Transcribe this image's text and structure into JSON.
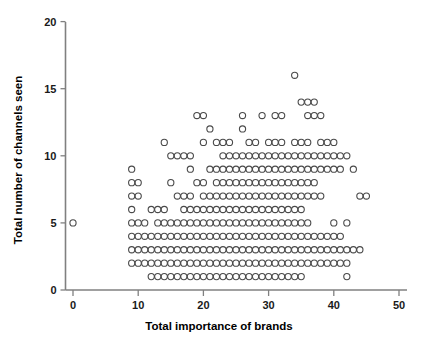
{
  "chart_data": {
    "type": "scatter",
    "title": "",
    "xlabel": "Total importance of brands",
    "ylabel": "Total number of channels seen",
    "xlim": [
      0,
      50
    ],
    "ylim": [
      0,
      20
    ],
    "xticks": [
      0,
      10,
      20,
      30,
      40,
      50
    ],
    "yticks": [
      0,
      5,
      10,
      15,
      20
    ],
    "xtick_labels": [
      "0",
      "10",
      "20",
      "30",
      "40",
      "50"
    ],
    "ytick_labels": [
      "0",
      "5",
      "10",
      "15",
      "20"
    ],
    "grid": false,
    "legend": null,
    "marker": {
      "shape": "open-circle",
      "radius_px": 3.1,
      "stroke": "#4a4a4a",
      "fill": "none"
    },
    "axis_color": "#808080",
    "points": [
      [
        0,
        5
      ],
      [
        9,
        9
      ],
      [
        9,
        8
      ],
      [
        9,
        7
      ],
      [
        9,
        6
      ],
      [
        9,
        5
      ],
      [
        9,
        4
      ],
      [
        9,
        3
      ],
      [
        9,
        2
      ],
      [
        10,
        8
      ],
      [
        10,
        7
      ],
      [
        10,
        5
      ],
      [
        10,
        4
      ],
      [
        10,
        3
      ],
      [
        10,
        2
      ],
      [
        11,
        5
      ],
      [
        11,
        4
      ],
      [
        11,
        3
      ],
      [
        11,
        2
      ],
      [
        12,
        6
      ],
      [
        12,
        4
      ],
      [
        12,
        3
      ],
      [
        12,
        2
      ],
      [
        12,
        1
      ],
      [
        13,
        6
      ],
      [
        13,
        5
      ],
      [
        13,
        4
      ],
      [
        13,
        3
      ],
      [
        13,
        2
      ],
      [
        13,
        1
      ],
      [
        14,
        11
      ],
      [
        14,
        6
      ],
      [
        14,
        5
      ],
      [
        14,
        4
      ],
      [
        14,
        3
      ],
      [
        14,
        2
      ],
      [
        14,
        1
      ],
      [
        15,
        10
      ],
      [
        15,
        8
      ],
      [
        15,
        5
      ],
      [
        15,
        4
      ],
      [
        15,
        3
      ],
      [
        15,
        2
      ],
      [
        15,
        1
      ],
      [
        16,
        10
      ],
      [
        16,
        7
      ],
      [
        16,
        5
      ],
      [
        16,
        4
      ],
      [
        16,
        3
      ],
      [
        16,
        2
      ],
      [
        16,
        1
      ],
      [
        17,
        10
      ],
      [
        17,
        7
      ],
      [
        17,
        6
      ],
      [
        17,
        5
      ],
      [
        17,
        4
      ],
      [
        17,
        3
      ],
      [
        17,
        2
      ],
      [
        17,
        1
      ],
      [
        18,
        10
      ],
      [
        18,
        9
      ],
      [
        18,
        7
      ],
      [
        18,
        6
      ],
      [
        18,
        5
      ],
      [
        18,
        4
      ],
      [
        18,
        3
      ],
      [
        18,
        2
      ],
      [
        18,
        1
      ],
      [
        19,
        13
      ],
      [
        19,
        8
      ],
      [
        19,
        6
      ],
      [
        19,
        5
      ],
      [
        19,
        4
      ],
      [
        19,
        3
      ],
      [
        19,
        2
      ],
      [
        19,
        1
      ],
      [
        20,
        13
      ],
      [
        20,
        11
      ],
      [
        20,
        8
      ],
      [
        20,
        7
      ],
      [
        20,
        6
      ],
      [
        20,
        5
      ],
      [
        20,
        4
      ],
      [
        20,
        3
      ],
      [
        20,
        2
      ],
      [
        20,
        1
      ],
      [
        21,
        12
      ],
      [
        21,
        9
      ],
      [
        21,
        7
      ],
      [
        21,
        6
      ],
      [
        21,
        5
      ],
      [
        21,
        4
      ],
      [
        21,
        3
      ],
      [
        21,
        2
      ],
      [
        21,
        1
      ],
      [
        22,
        11
      ],
      [
        22,
        9
      ],
      [
        22,
        8
      ],
      [
        22,
        7
      ],
      [
        22,
        6
      ],
      [
        22,
        5
      ],
      [
        22,
        4
      ],
      [
        22,
        3
      ],
      [
        22,
        2
      ],
      [
        22,
        1
      ],
      [
        23,
        11
      ],
      [
        23,
        10
      ],
      [
        23,
        9
      ],
      [
        23,
        8
      ],
      [
        23,
        7
      ],
      [
        23,
        6
      ],
      [
        23,
        5
      ],
      [
        23,
        4
      ],
      [
        23,
        3
      ],
      [
        23,
        2
      ],
      [
        23,
        1
      ],
      [
        24,
        11
      ],
      [
        24,
        10
      ],
      [
        24,
        9
      ],
      [
        24,
        8
      ],
      [
        24,
        7
      ],
      [
        24,
        6
      ],
      [
        24,
        5
      ],
      [
        24,
        4
      ],
      [
        24,
        3
      ],
      [
        24,
        2
      ],
      [
        24,
        1
      ],
      [
        25,
        10
      ],
      [
        25,
        9
      ],
      [
        25,
        8
      ],
      [
        25,
        7
      ],
      [
        25,
        6
      ],
      [
        25,
        5
      ],
      [
        25,
        4
      ],
      [
        25,
        3
      ],
      [
        25,
        2
      ],
      [
        25,
        1
      ],
      [
        26,
        13
      ],
      [
        26,
        12
      ],
      [
        26,
        10
      ],
      [
        26,
        9
      ],
      [
        26,
        8
      ],
      [
        26,
        7
      ],
      [
        26,
        6
      ],
      [
        26,
        5
      ],
      [
        26,
        4
      ],
      [
        26,
        3
      ],
      [
        26,
        2
      ],
      [
        26,
        1
      ],
      [
        27,
        11
      ],
      [
        27,
        10
      ],
      [
        27,
        9
      ],
      [
        27,
        8
      ],
      [
        27,
        7
      ],
      [
        27,
        6
      ],
      [
        27,
        5
      ],
      [
        27,
        4
      ],
      [
        27,
        3
      ],
      [
        27,
        2
      ],
      [
        27,
        1
      ],
      [
        28,
        11
      ],
      [
        28,
        10
      ],
      [
        28,
        9
      ],
      [
        28,
        8
      ],
      [
        28,
        7
      ],
      [
        28,
        6
      ],
      [
        28,
        5
      ],
      [
        28,
        4
      ],
      [
        28,
        3
      ],
      [
        28,
        2
      ],
      [
        28,
        1
      ],
      [
        29,
        13
      ],
      [
        29,
        10
      ],
      [
        29,
        9
      ],
      [
        29,
        8
      ],
      [
        29,
        7
      ],
      [
        29,
        6
      ],
      [
        29,
        5
      ],
      [
        29,
        4
      ],
      [
        29,
        3
      ],
      [
        29,
        2
      ],
      [
        29,
        1
      ],
      [
        30,
        11
      ],
      [
        30,
        10
      ],
      [
        30,
        9
      ],
      [
        30,
        8
      ],
      [
        30,
        7
      ],
      [
        30,
        6
      ],
      [
        30,
        5
      ],
      [
        30,
        4
      ],
      [
        30,
        3
      ],
      [
        30,
        2
      ],
      [
        30,
        1
      ],
      [
        31,
        13
      ],
      [
        31,
        11
      ],
      [
        31,
        10
      ],
      [
        31,
        9
      ],
      [
        31,
        8
      ],
      [
        31,
        7
      ],
      [
        31,
        6
      ],
      [
        31,
        5
      ],
      [
        31,
        4
      ],
      [
        31,
        3
      ],
      [
        31,
        2
      ],
      [
        31,
        1
      ],
      [
        32,
        13
      ],
      [
        32,
        11
      ],
      [
        32,
        10
      ],
      [
        32,
        9
      ],
      [
        32,
        8
      ],
      [
        32,
        7
      ],
      [
        32,
        6
      ],
      [
        32,
        5
      ],
      [
        32,
        4
      ],
      [
        32,
        3
      ],
      [
        32,
        2
      ],
      [
        32,
        1
      ],
      [
        33,
        10
      ],
      [
        33,
        9
      ],
      [
        33,
        8
      ],
      [
        33,
        7
      ],
      [
        33,
        6
      ],
      [
        33,
        5
      ],
      [
        33,
        4
      ],
      [
        33,
        3
      ],
      [
        33,
        2
      ],
      [
        33,
        1
      ],
      [
        34,
        16
      ],
      [
        34,
        11
      ],
      [
        34,
        10
      ],
      [
        34,
        9
      ],
      [
        34,
        8
      ],
      [
        34,
        7
      ],
      [
        34,
        6
      ],
      [
        34,
        5
      ],
      [
        34,
        4
      ],
      [
        34,
        3
      ],
      [
        34,
        2
      ],
      [
        34,
        1
      ],
      [
        35,
        14
      ],
      [
        35,
        11
      ],
      [
        35,
        10
      ],
      [
        35,
        9
      ],
      [
        35,
        8
      ],
      [
        35,
        7
      ],
      [
        35,
        6
      ],
      [
        35,
        5
      ],
      [
        35,
        4
      ],
      [
        35,
        3
      ],
      [
        35,
        2
      ],
      [
        35,
        1
      ],
      [
        36,
        14
      ],
      [
        36,
        13
      ],
      [
        36,
        11
      ],
      [
        36,
        10
      ],
      [
        36,
        9
      ],
      [
        36,
        8
      ],
      [
        36,
        7
      ],
      [
        36,
        5
      ],
      [
        36,
        4
      ],
      [
        36,
        3
      ],
      [
        36,
        2
      ],
      [
        37,
        14
      ],
      [
        37,
        13
      ],
      [
        37,
        10
      ],
      [
        37,
        9
      ],
      [
        37,
        8
      ],
      [
        37,
        7
      ],
      [
        37,
        4
      ],
      [
        37,
        3
      ],
      [
        37,
        2
      ],
      [
        38,
        13
      ],
      [
        38,
        11
      ],
      [
        38,
        10
      ],
      [
        38,
        9
      ],
      [
        38,
        7
      ],
      [
        38,
        4
      ],
      [
        38,
        3
      ],
      [
        38,
        2
      ],
      [
        39,
        11
      ],
      [
        39,
        10
      ],
      [
        39,
        9
      ],
      [
        39,
        4
      ],
      [
        39,
        3
      ],
      [
        39,
        2
      ],
      [
        40,
        11
      ],
      [
        40,
        10
      ],
      [
        40,
        9
      ],
      [
        40,
        5
      ],
      [
        40,
        4
      ],
      [
        40,
        3
      ],
      [
        40,
        2
      ],
      [
        41,
        10
      ],
      [
        41,
        9
      ],
      [
        41,
        4
      ],
      [
        41,
        3
      ],
      [
        41,
        2
      ],
      [
        42,
        10
      ],
      [
        42,
        5
      ],
      [
        42,
        3
      ],
      [
        42,
        2
      ],
      [
        42,
        1
      ],
      [
        43,
        9
      ],
      [
        43,
        3
      ],
      [
        44,
        7
      ],
      [
        44,
        3
      ],
      [
        45,
        7
      ]
    ]
  }
}
